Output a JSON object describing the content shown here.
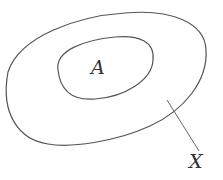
{
  "diagram": {
    "type": "set-diagram",
    "outer_set": {
      "label": "X"
    },
    "inner_set": {
      "label": "A"
    },
    "relation": "A is a subset of X",
    "stroke_color": "#555555"
  }
}
